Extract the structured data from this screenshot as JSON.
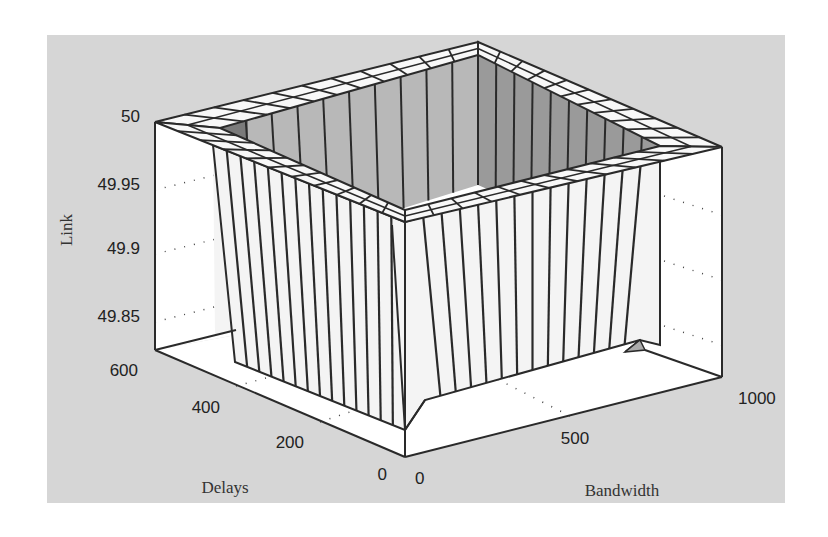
{
  "chart_data": {
    "type": "surface3d",
    "title": "",
    "zlabel": "Link",
    "xlabel": "Bandwidth",
    "ylabel": "Delays",
    "z_ticks": [
      "50",
      "49.95",
      "49.9",
      "49.85"
    ],
    "z_tick_values": [
      50,
      49.95,
      49.9,
      49.85
    ],
    "zlim": [
      49.8,
      50
    ],
    "x_ticks": [
      "0",
      "500",
      "1000"
    ],
    "x_tick_values": [
      0,
      500,
      1000
    ],
    "xlim": [
      0,
      1000
    ],
    "y_ticks": [
      "600",
      "400",
      "200",
      "0"
    ],
    "y_tick_values": [
      600,
      400,
      200,
      0
    ],
    "ylim": [
      0,
      600
    ],
    "grid": true,
    "surface_summary": {
      "interior_value": 50,
      "edge_value_approx": 49.8,
      "grid_segments_per_side": 20
    }
  },
  "colors": {
    "panel_bg": "#d6d6d6",
    "page_bg": "#ffffff",
    "face_light": "#f4f4f4",
    "inner_back_left": "#b8b8b8",
    "inner_back_right": "#9a9a9a",
    "inner_corner_dark": "#7a7a7a",
    "rim": "#f8f8f8",
    "line": "#2a2a2a"
  }
}
